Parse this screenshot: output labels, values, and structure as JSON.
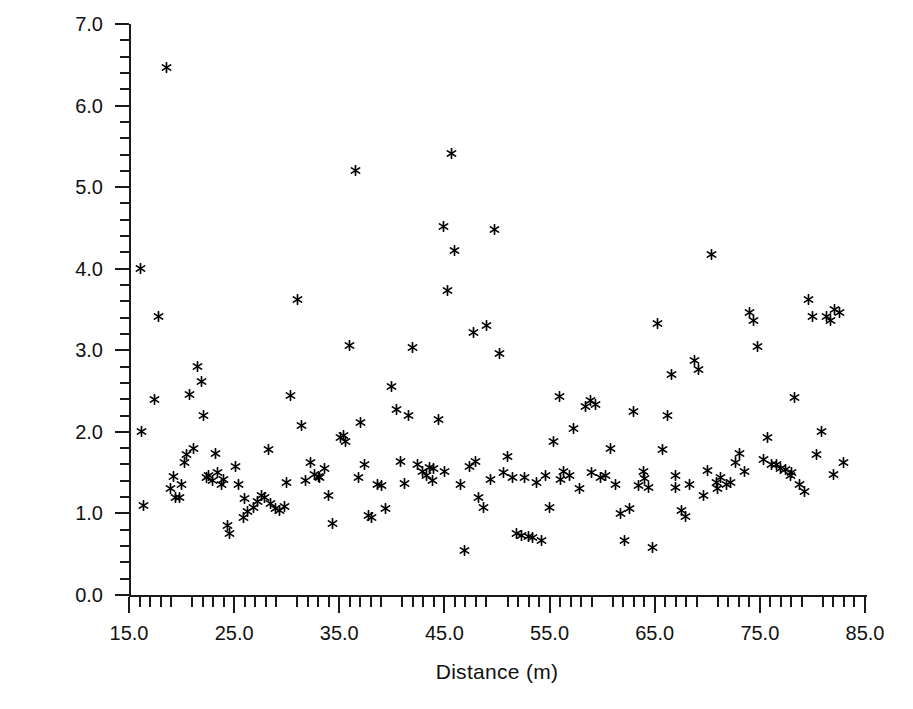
{
  "chart_data": {
    "type": "scatter",
    "title": "",
    "xlabel": "Distance (m)",
    "ylabel": "Standard deviation (dBm)",
    "xlim": [
      15.0,
      85.0
    ],
    "ylim": [
      0.0,
      7.0
    ],
    "grid": false,
    "legend": null,
    "marker": "asterisk",
    "marker_color": "#000000",
    "x_ticks": [
      15.0,
      25.0,
      35.0,
      45.0,
      55.0,
      65.0,
      75.0,
      85.0
    ],
    "x_tick_labels": [
      "15.0",
      "25.0",
      "35.0",
      "45.0",
      "55.0",
      "65.0",
      "75.0",
      "85.0"
    ],
    "x_minor_interval": 1.0,
    "y_ticks": [
      0.0,
      1.0,
      2.0,
      3.0,
      4.0,
      5.0,
      6.0,
      7.0
    ],
    "y_tick_labels": [
      "0.0",
      "1.0",
      "2.0",
      "3.0",
      "4.0",
      "5.0",
      "6.0",
      "7.0"
    ],
    "y_minor_interval": 0.2,
    "n_points": 177,
    "points": [
      [
        16.1,
        4.0
      ],
      [
        16.2,
        2.0
      ],
      [
        16.4,
        1.1
      ],
      [
        17.4,
        2.4
      ],
      [
        17.8,
        3.42
      ],
      [
        18.6,
        6.47
      ],
      [
        19.2,
        1.45
      ],
      [
        19.4,
        1.2
      ],
      [
        19.8,
        1.19
      ],
      [
        20.3,
        1.62
      ],
      [
        20.5,
        1.72
      ],
      [
        20.8,
        2.46
      ],
      [
        21.1,
        1.8
      ],
      [
        21.5,
        2.8
      ],
      [
        21.9,
        2.62
      ],
      [
        22.1,
        2.2
      ],
      [
        22.4,
        1.44
      ],
      [
        22.6,
        1.46
      ],
      [
        22.9,
        1.4
      ],
      [
        23.2,
        1.74
      ],
      [
        23.4,
        1.5
      ],
      [
        23.8,
        1.35
      ],
      [
        24.4,
        0.85
      ],
      [
        24.6,
        0.75
      ],
      [
        25.1,
        1.57
      ],
      [
        25.4,
        1.35
      ],
      [
        25.9,
        0.95
      ],
      [
        26.3,
        1.02
      ],
      [
        26.8,
        1.07
      ],
      [
        27.2,
        1.15
      ],
      [
        27.6,
        1.22
      ],
      [
        27.9,
        1.2
      ],
      [
        28.3,
        1.78
      ],
      [
        28.5,
        1.12
      ],
      [
        28.9,
        1.06
      ],
      [
        29.3,
        1.04
      ],
      [
        29.8,
        1.09
      ],
      [
        30.4,
        2.44
      ],
      [
        31.0,
        3.62
      ],
      [
        31.4,
        2.08
      ],
      [
        31.8,
        1.4
      ],
      [
        32.3,
        1.62
      ],
      [
        32.6,
        1.48
      ],
      [
        33.1,
        1.44
      ],
      [
        33.6,
        1.55
      ],
      [
        34.0,
        1.22
      ],
      [
        34.4,
        0.88
      ],
      [
        35.1,
        1.93
      ],
      [
        35.4,
        1.96
      ],
      [
        35.6,
        1.88
      ],
      [
        36.0,
        3.06
      ],
      [
        36.5,
        5.2
      ],
      [
        37.0,
        2.12
      ],
      [
        37.4,
        1.6
      ],
      [
        37.8,
        0.98
      ],
      [
        38.1,
        0.95
      ],
      [
        38.6,
        1.35
      ],
      [
        39.0,
        1.34
      ],
      [
        39.4,
        1.06
      ],
      [
        40.0,
        2.56
      ],
      [
        40.4,
        2.28
      ],
      [
        40.8,
        1.64
      ],
      [
        41.2,
        1.37
      ],
      [
        41.6,
        2.2
      ],
      [
        42.0,
        3.04
      ],
      [
        42.4,
        1.6
      ],
      [
        42.9,
        1.52
      ],
      [
        43.3,
        1.47
      ],
      [
        43.6,
        1.56
      ],
      [
        44.0,
        1.55
      ],
      [
        44.4,
        2.15
      ],
      [
        44.9,
        4.52
      ],
      [
        45.3,
        3.73
      ],
      [
        45.7,
        5.41
      ],
      [
        46.0,
        4.22
      ],
      [
        46.5,
        1.35
      ],
      [
        46.9,
        0.54
      ],
      [
        47.4,
        1.58
      ],
      [
        47.8,
        3.22
      ],
      [
        48.2,
        1.2
      ],
      [
        48.7,
        1.07
      ],
      [
        49.0,
        3.3
      ],
      [
        49.4,
        1.42
      ],
      [
        49.8,
        4.48
      ],
      [
        50.2,
        2.96
      ],
      [
        50.6,
        1.5
      ],
      [
        51.0,
        1.7
      ],
      [
        51.5,
        1.44
      ],
      [
        51.9,
        0.76
      ],
      [
        52.3,
        0.73
      ],
      [
        52.6,
        1.44
      ],
      [
        53.0,
        0.72
      ],
      [
        53.4,
        0.7
      ],
      [
        53.8,
        1.38
      ],
      [
        54.2,
        0.67
      ],
      [
        54.6,
        1.47
      ],
      [
        55.0,
        1.07
      ],
      [
        55.4,
        1.88
      ],
      [
        55.9,
        2.43
      ],
      [
        56.3,
        1.52
      ],
      [
        56.9,
        1.46
      ],
      [
        57.3,
        2.04
      ],
      [
        57.8,
        1.3
      ],
      [
        58.4,
        2.31
      ],
      [
        58.9,
        2.38
      ],
      [
        59.4,
        2.33
      ],
      [
        59.8,
        1.44
      ],
      [
        60.3,
        1.46
      ],
      [
        60.8,
        1.8
      ],
      [
        61.3,
        1.36
      ],
      [
        61.7,
        1.0
      ],
      [
        62.1,
        0.67
      ],
      [
        62.6,
        1.06
      ],
      [
        63.0,
        2.25
      ],
      [
        63.5,
        1.34
      ],
      [
        63.9,
        1.51
      ],
      [
        64.4,
        1.32
      ],
      [
        64.8,
        0.58
      ],
      [
        65.3,
        3.33
      ],
      [
        65.7,
        1.78
      ],
      [
        66.2,
        2.2
      ],
      [
        66.6,
        2.7
      ],
      [
        67.0,
        1.46
      ],
      [
        67.5,
        1.04
      ],
      [
        67.9,
        0.96
      ],
      [
        68.3,
        1.36
      ],
      [
        68.8,
        2.88
      ],
      [
        69.2,
        2.77
      ],
      [
        69.6,
        1.22
      ],
      [
        70.0,
        1.53
      ],
      [
        70.4,
        4.17
      ],
      [
        70.9,
        1.38
      ],
      [
        71.3,
        1.44
      ],
      [
        71.8,
        1.36
      ],
      [
        72.2,
        1.38
      ],
      [
        72.7,
        1.62
      ],
      [
        73.1,
        1.74
      ],
      [
        73.5,
        1.52
      ],
      [
        74.0,
        3.46
      ],
      [
        74.4,
        3.37
      ],
      [
        74.8,
        3.05
      ],
      [
        75.3,
        1.66
      ],
      [
        75.7,
        1.93
      ],
      [
        76.1,
        1.6
      ],
      [
        76.6,
        1.6
      ],
      [
        77.0,
        1.55
      ],
      [
        77.4,
        1.54
      ],
      [
        77.9,
        1.46
      ],
      [
        78.3,
        2.42
      ],
      [
        78.8,
        1.36
      ],
      [
        79.2,
        1.27
      ],
      [
        79.6,
        3.62
      ],
      [
        80.0,
        3.42
      ],
      [
        80.4,
        1.72
      ],
      [
        80.9,
        2.0
      ],
      [
        81.3,
        3.41
      ],
      [
        81.7,
        3.37
      ],
      [
        82.1,
        3.5
      ],
      [
        82.6,
        3.46
      ],
      [
        83.0,
        1.62
      ],
      [
        18.9,
        1.3
      ],
      [
        24.0,
        1.42
      ],
      [
        30.0,
        1.38
      ],
      [
        36.8,
        1.44
      ],
      [
        43.9,
        1.4
      ],
      [
        48.0,
        1.64
      ],
      [
        56.0,
        1.42
      ],
      [
        64.0,
        1.43
      ],
      [
        71.0,
        1.3
      ],
      [
        78.0,
        1.5
      ],
      [
        20.0,
        1.35
      ],
      [
        33.0,
        1.45
      ],
      [
        45.0,
        1.52
      ],
      [
        59.0,
        1.5
      ],
      [
        67.0,
        1.32
      ],
      [
        82.0,
        1.48
      ],
      [
        26.0,
        1.18
      ]
    ]
  },
  "axes": {
    "y_axis_name": "y-axis",
    "x_axis_name": "x-axis"
  }
}
